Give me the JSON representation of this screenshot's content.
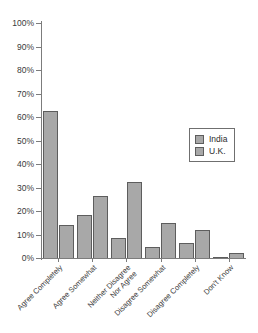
{
  "chart_data": {
    "type": "bar",
    "title": "",
    "subtitle": "",
    "xlabel": "",
    "ylabel": "",
    "ylim": [
      0,
      100
    ],
    "y_unit": "%",
    "grid": false,
    "legend_position": "right-middle",
    "y_ticks": [
      "0%",
      "10%",
      "20%",
      "30%",
      "40%",
      "50%",
      "60%",
      "70%",
      "80%",
      "90%",
      "100%"
    ],
    "y_tick_values": [
      0,
      10,
      20,
      30,
      40,
      50,
      60,
      70,
      80,
      90,
      100
    ],
    "categories": [
      "Agree Completely",
      "Agree Somewhat",
      "Neither Disagree Nor Agree",
      "Disagree Somewhat",
      "Disagree Completely",
      "Don't Know"
    ],
    "series": [
      {
        "name": "India",
        "color": "#a8a8a8",
        "values": [
          62.5,
          18.5,
          8.5,
          4.5,
          6.5,
          0.5
        ]
      },
      {
        "name": "U.K.",
        "color": "#a8a8a8",
        "values": [
          14,
          26.5,
          32.5,
          15,
          12,
          2
        ]
      }
    ]
  },
  "legend": {
    "items": [
      {
        "label": "India"
      },
      {
        "label": "U.K."
      }
    ]
  },
  "colors": {
    "bar_fill": "#a8a8a8",
    "bar_stroke": "#5d5d5d",
    "axis": "#7c7c7c",
    "text": "#2b2b2b",
    "background": "#ffffff"
  }
}
